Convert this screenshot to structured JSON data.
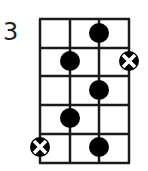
{
  "diagram": {
    "type": "chord-diagram",
    "start_fret_label": "3",
    "strings": 4,
    "frets": 5,
    "markers": [
      {
        "fret": 1,
        "string": 3,
        "kind": "dot"
      },
      {
        "fret": 2,
        "string": 2,
        "kind": "dot"
      },
      {
        "fret": 2,
        "string": 4,
        "kind": "x-marker"
      },
      {
        "fret": 3,
        "string": 3,
        "kind": "dot"
      },
      {
        "fret": 4,
        "string": 2,
        "kind": "dot"
      },
      {
        "fret": 5,
        "string": 1,
        "kind": "x-marker"
      },
      {
        "fret": 5,
        "string": 3,
        "kind": "dot"
      }
    ],
    "colors": {
      "line": "#1a1a1a",
      "dot": "#000000",
      "background": "#ffffff"
    }
  }
}
